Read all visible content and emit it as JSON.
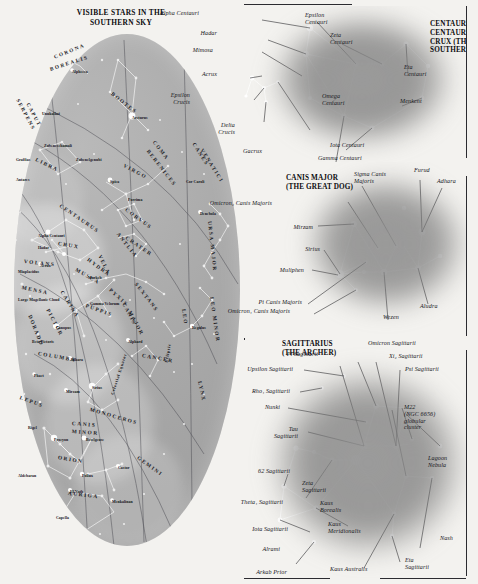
{
  "map": {
    "title": "VISIBLE STARS IN THE\nSOUTHERN SKY",
    "constellations": [
      {
        "name": "CORONA",
        "x": 40,
        "y": 20,
        "rot": -22
      },
      {
        "name": "BOREALIS",
        "x": 36,
        "y": 32,
        "rot": -18
      },
      {
        "name": "SERPENS",
        "x": 4,
        "y": 62,
        "rot": 62
      },
      {
        "name": "CAPUT",
        "x": 14,
        "y": 66,
        "rot": 62
      },
      {
        "name": "BOOTES",
        "x": 98,
        "y": 56,
        "rot": 38
      },
      {
        "name": "LIBRA",
        "x": 22,
        "y": 122,
        "rot": 26
      },
      {
        "name": "VIRGO",
        "x": 110,
        "y": 128,
        "rot": 28
      },
      {
        "name": "COMA",
        "x": 140,
        "y": 104,
        "rot": 52
      },
      {
        "name": "BERENICES",
        "x": 134,
        "y": 113,
        "rot": 52
      },
      {
        "name": "CANES",
        "x": 180,
        "y": 106,
        "rot": 58
      },
      {
        "name": "VENATICI",
        "x": 188,
        "y": 112,
        "rot": 58
      },
      {
        "name": "CENTAURUS",
        "x": 46,
        "y": 168,
        "rot": 34
      },
      {
        "name": "CRUX",
        "x": 44,
        "y": 206,
        "rot": 10
      },
      {
        "name": "VOLANS",
        "x": 10,
        "y": 224,
        "rot": 6
      },
      {
        "name": "MENSA",
        "x": 8,
        "y": 250,
        "rot": 12
      },
      {
        "name": "DORADO",
        "x": 16,
        "y": 278,
        "rot": 68
      },
      {
        "name": "PICTOR",
        "x": 34,
        "y": 272,
        "rot": 62
      },
      {
        "name": "CARINA",
        "x": 48,
        "y": 254,
        "rot": 58
      },
      {
        "name": "VELA",
        "x": 86,
        "y": 218,
        "rot": 64
      },
      {
        "name": "MUSCA",
        "x": 62,
        "y": 232,
        "rot": 30
      },
      {
        "name": "ANTLIA",
        "x": 104,
        "y": 196,
        "rot": 52
      },
      {
        "name": "CRATER",
        "x": 112,
        "y": 200,
        "rot": 34
      },
      {
        "name": "CORVUS",
        "x": 112,
        "y": 172,
        "rot": 36
      },
      {
        "name": "HYDRA",
        "x": 74,
        "y": 222,
        "rot": 36
      },
      {
        "name": "PUPPIS",
        "x": 72,
        "y": 268,
        "rot": 20
      },
      {
        "name": "COLUMBA",
        "x": 24,
        "y": 316,
        "rot": 10
      },
      {
        "name": "LEPUS",
        "x": 6,
        "y": 360,
        "rot": 20
      },
      {
        "name": "CANIS",
        "x": 110,
        "y": 266,
        "rot": 62
      },
      {
        "name": "MAJOR",
        "x": 116,
        "y": 274,
        "rot": 62
      },
      {
        "name": "MONOCEROS",
        "x": 76,
        "y": 372,
        "rot": 16
      },
      {
        "name": "ORION",
        "x": 44,
        "y": 420,
        "rot": 10
      },
      {
        "name": "AURIGA",
        "x": 54,
        "y": 456,
        "rot": 6
      },
      {
        "name": "GEMINI",
        "x": 124,
        "y": 420,
        "rot": 36
      },
      {
        "name": "CANCER",
        "x": 128,
        "y": 318,
        "rot": 10
      },
      {
        "name": "LEO",
        "x": 170,
        "y": 272,
        "rot": 82
      },
      {
        "name": "LEO MINOR",
        "x": 198,
        "y": 260,
        "rot": 82
      },
      {
        "name": "URSA MAJOR",
        "x": 196,
        "y": 184,
        "rot": 84
      },
      {
        "name": "LYNX",
        "x": 186,
        "y": 344,
        "rot": 78
      },
      {
        "name": "CANIS",
        "x": 58,
        "y": 386,
        "rot": 4
      },
      {
        "name": "MINOR",
        "x": 58,
        "y": 394,
        "rot": 4
      },
      {
        "name": "SEXTANS",
        "x": 122,
        "y": 246,
        "rot": 52
      },
      {
        "name": "PYXIS",
        "x": 96,
        "y": 252,
        "rot": 42
      }
    ],
    "stars": [
      {
        "name": "Alphecca",
        "x": 58,
        "y": 36
      },
      {
        "name": "Unukalhai",
        "x": 28,
        "y": 78
      },
      {
        "name": "Arcturus",
        "x": 118,
        "y": 82
      },
      {
        "name": "Zubeneschamali",
        "x": 30,
        "y": 110
      },
      {
        "name": "Zubenelgenubi",
        "x": 62,
        "y": 124
      },
      {
        "name": "Graffias",
        "x": 2,
        "y": 124
      },
      {
        "name": "Antares",
        "x": 2,
        "y": 144
      },
      {
        "name": "Spica",
        "x": 96,
        "y": 146
      },
      {
        "name": "Porrima",
        "x": 114,
        "y": 164
      },
      {
        "name": "Cor Caroli",
        "x": 172,
        "y": 146
      },
      {
        "name": "Denebola",
        "x": 186,
        "y": 178
      },
      {
        "name": "Alpha Centauri",
        "x": 24,
        "y": 200
      },
      {
        "name": "Hadar",
        "x": 24,
        "y": 212
      },
      {
        "name": "Acrux",
        "x": 26,
        "y": 230
      },
      {
        "name": "Miaplacidus",
        "x": 4,
        "y": 236
      },
      {
        "name": "Large Magellanic Cloud",
        "x": 4,
        "y": 264
      },
      {
        "name": "Markeb",
        "x": 74,
        "y": 242
      },
      {
        "name": "Gamma Velorum",
        "x": 76,
        "y": 268
      },
      {
        "name": "Canopus",
        "x": 42,
        "y": 292
      },
      {
        "name": "Beta Pictoris",
        "x": 18,
        "y": 306
      },
      {
        "name": "Adhara",
        "x": 56,
        "y": 324
      },
      {
        "name": "Phact",
        "x": 20,
        "y": 340
      },
      {
        "name": "Mirzam",
        "x": 52,
        "y": 356
      },
      {
        "name": "Sirius",
        "x": 78,
        "y": 352
      },
      {
        "name": "Alphard",
        "x": 114,
        "y": 306
      },
      {
        "name": "Regulus",
        "x": 178,
        "y": 292
      },
      {
        "name": "Procyon",
        "x": 40,
        "y": 404
      },
      {
        "name": "Pollux",
        "x": 68,
        "y": 440
      },
      {
        "name": "Castor",
        "x": 104,
        "y": 432
      },
      {
        "name": "Rigel",
        "x": 14,
        "y": 392
      },
      {
        "name": "Betelgeuse",
        "x": 72,
        "y": 404
      },
      {
        "name": "Aldebaran",
        "x": 4,
        "y": 440
      },
      {
        "name": "El Nath",
        "x": 56,
        "y": 456
      },
      {
        "name": "Menkalinan",
        "x": 98,
        "y": 466
      },
      {
        "name": "Capella",
        "x": 42,
        "y": 482
      }
    ],
    "lines": [
      {
        "name": "Celestial Equator",
        "x": 98,
        "y": 358,
        "rot": -72
      },
      {
        "name": "Ecliptic",
        "x": 152,
        "y": 326,
        "rot": -80
      }
    ]
  },
  "centaurus": {
    "title": "CENTAURUS (THE\nCENTAUR) AND\nCRUX (THE\nSOUTHERN CROSS)",
    "labels": [
      {
        "id": "alpha-centauri",
        "text": "Alpha Centauri",
        "x": 199,
        "y": 10,
        "align": "right"
      },
      {
        "id": "hadar",
        "text": "Hadar",
        "x": 217,
        "y": 30,
        "align": "right"
      },
      {
        "id": "mimosa",
        "text": "Mimosa",
        "x": 213,
        "y": 47,
        "align": "right"
      },
      {
        "id": "acrux",
        "text": "Acrux",
        "x": 217,
        "y": 71,
        "align": "right"
      },
      {
        "id": "epsilon-crucis",
        "text": "Epsilon\nCrucis",
        "x": 190,
        "y": 92,
        "align": "right"
      },
      {
        "id": "delta-crucis",
        "text": "Delta\nCrucis",
        "x": 235,
        "y": 122,
        "align": "right"
      },
      {
        "id": "gacrux",
        "text": "Gacrux",
        "x": 262,
        "y": 148,
        "align": "right"
      },
      {
        "id": "epsilon-centauri",
        "text": "Epsilon\nCentauri",
        "x": 305,
        "y": 12,
        "align": "left"
      },
      {
        "id": "zeta-centauri",
        "text": "Zeta\nCentauri",
        "x": 330,
        "y": 32,
        "align": "left"
      },
      {
        "id": "omega-centauri",
        "text": "Omega\nCentauri",
        "x": 322,
        "y": 93,
        "align": "left"
      },
      {
        "id": "eta-centauri",
        "text": "Eta\nCentauri",
        "x": 404,
        "y": 64,
        "align": "left"
      },
      {
        "id": "menkent",
        "text": "Menkent",
        "x": 400,
        "y": 98,
        "align": "left"
      },
      {
        "id": "iota-centauri",
        "text": "Iota Centauri",
        "x": 330,
        "y": 142,
        "align": "left"
      },
      {
        "id": "gamma-centauri",
        "text": "Gamma Centauri",
        "x": 318,
        "y": 155,
        "align": "left"
      }
    ]
  },
  "canis_major": {
    "title": "CANIS MAJOR\n(THE GREAT DOG)",
    "labels": [
      {
        "id": "omicron2-canis-majoris",
        "text": "Omicron₂ Canis Majoris",
        "x": 272,
        "y": 200,
        "align": "right"
      },
      {
        "id": "mirzam",
        "text": "Mirzam",
        "x": 313,
        "y": 224,
        "align": "right"
      },
      {
        "id": "sirius",
        "text": "Sirius",
        "x": 320,
        "y": 246,
        "align": "right"
      },
      {
        "id": "muliphen",
        "text": "Muliphen",
        "x": 304,
        "y": 267,
        "align": "right"
      },
      {
        "id": "sigma-canis-majoris",
        "text": "Sigma Canis\nMajoris",
        "x": 354,
        "y": 171,
        "align": "left"
      },
      {
        "id": "furud",
        "text": "Furud",
        "x": 414,
        "y": 167,
        "align": "left"
      },
      {
        "id": "adhara",
        "text": "Adhara",
        "x": 437,
        "y": 178,
        "align": "left"
      },
      {
        "id": "pi-canis-majoris",
        "text": "Pi Canis Majoris",
        "x": 302,
        "y": 299,
        "align": "right"
      },
      {
        "id": "omicron1-canis-majoris",
        "text": "Omicron₁ Canis Majoris",
        "x": 290,
        "y": 308,
        "align": "right"
      },
      {
        "id": "wezen",
        "text": "Wezen",
        "x": 383,
        "y": 314,
        "align": "left"
      },
      {
        "id": "aludra",
        "text": "Aludra",
        "x": 420,
        "y": 303,
        "align": "left"
      }
    ]
  },
  "sagittarius": {
    "title": "SAGITTARIUS\n(THE ARCHER)",
    "labels": [
      {
        "id": "pi-sagittarii",
        "text": "Pi Sagittarii",
        "x": 318,
        "y": 351,
        "align": "right"
      },
      {
        "id": "upsilon-sagittarii",
        "text": "Upsilon Sagittarii",
        "x": 293,
        "y": 366,
        "align": "right"
      },
      {
        "id": "rho1-sagittarii",
        "text": "Rho₁ Sagittarii",
        "x": 290,
        "y": 388,
        "align": "right"
      },
      {
        "id": "nunki",
        "text": "Nunki",
        "x": 280,
        "y": 404,
        "align": "right"
      },
      {
        "id": "tau-sagittarii",
        "text": "Tau\nSagittarii",
        "x": 298,
        "y": 426,
        "align": "right"
      },
      {
        "id": "62-sagittarii",
        "text": "62 Sagittarii",
        "x": 290,
        "y": 468,
        "align": "right"
      },
      {
        "id": "theta1-sagittarii",
        "text": "Theta₁ Sagittarii",
        "x": 283,
        "y": 499,
        "align": "right"
      },
      {
        "id": "iota-sagittarii",
        "text": "Iota Sagittarii",
        "x": 288,
        "y": 526,
        "align": "right"
      },
      {
        "id": "alrami",
        "text": "Alrami",
        "x": 280,
        "y": 546,
        "align": "right"
      },
      {
        "id": "arkab-prior",
        "text": "Arkab Prior",
        "x": 287,
        "y": 569,
        "align": "right"
      },
      {
        "id": "omicron-sagittarii",
        "text": "Omicron Sagittarii",
        "x": 368,
        "y": 340,
        "align": "left"
      },
      {
        "id": "xi2-sagittarii",
        "text": "Xi₂ Sagittarii",
        "x": 389,
        "y": 353,
        "align": "left"
      },
      {
        "id": "psi-sagittarii",
        "text": "Psi Sagittarii",
        "x": 405,
        "y": 366,
        "align": "left"
      },
      {
        "id": "m22",
        "text": "M22\n(NGC 6656)\nglobular\ncluster",
        "x": 404,
        "y": 404,
        "align": "left"
      },
      {
        "id": "lagoon-nebula",
        "text": "Lagoon\nNebula",
        "x": 428,
        "y": 455,
        "align": "left"
      },
      {
        "id": "zeta-sagittarii",
        "text": "Zeta\nSagittarii",
        "x": 302,
        "y": 480,
        "align": "left"
      },
      {
        "id": "kaus-borealis",
        "text": "Kaus\nBorealis",
        "x": 320,
        "y": 500,
        "align": "left"
      },
      {
        "id": "kaus-meridionalis",
        "text": "Kaus\nMeridionalis",
        "x": 328,
        "y": 521,
        "align": "left"
      },
      {
        "id": "kaus-australis",
        "text": "Kaus Australis",
        "x": 330,
        "y": 566,
        "align": "left"
      },
      {
        "id": "eta-sagittarii",
        "text": "Eta\nSagittarii",
        "x": 405,
        "y": 557,
        "align": "left"
      },
      {
        "id": "nash",
        "text": "Nash",
        "x": 440,
        "y": 535,
        "align": "left"
      }
    ]
  }
}
